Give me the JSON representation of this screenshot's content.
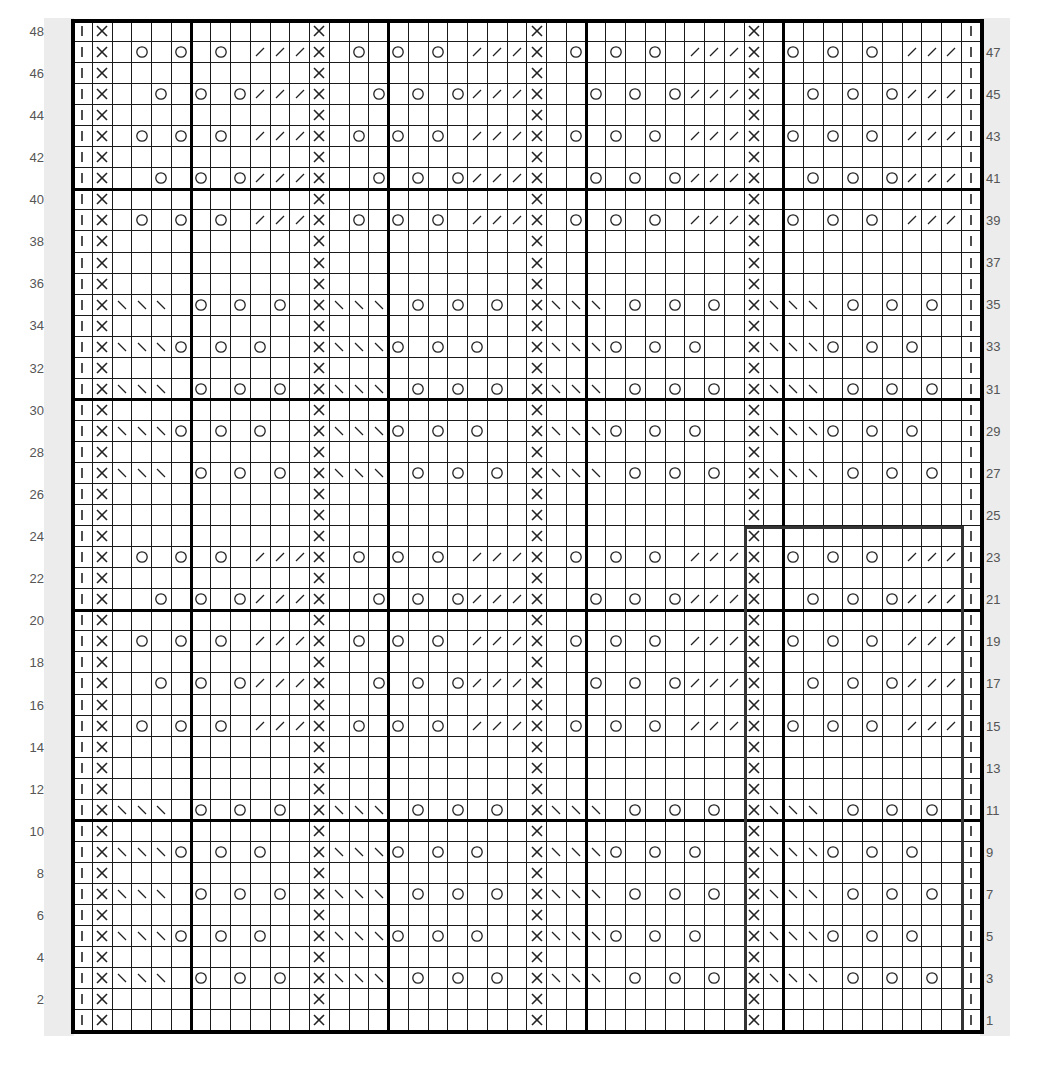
{
  "chart": {
    "columns": 46,
    "rows": 48,
    "repeat_width": 11,
    "repeat_start_col": 2,
    "edge_left_symbol": "knit-bar",
    "edge_right_symbol": "knit-bar",
    "thick_col_boundaries_after": [
      6,
      16,
      26,
      36
    ],
    "thick_row_boundaries_after": [
      10,
      20,
      30,
      40
    ],
    "highlight_box": {
      "col_start": 35,
      "col_end": 45,
      "row_start": 1,
      "row_end": 24,
      "color": "#333333"
    },
    "symbols": {
      "P": "blank",
      "X": "cross",
      "O": "yarn-over",
      "/": "slash-right",
      "\\": "slash-left",
      "_": "blank",
      "I": "knit-bar"
    },
    "row_types": {
      "A": [
        "X",
        "_",
        "O",
        "_",
        "O",
        "_",
        "O",
        "_",
        "/",
        "/",
        "/"
      ],
      "B": [
        "X",
        "_",
        "_",
        "O",
        "_",
        "O",
        "_",
        "O",
        "/",
        "/",
        "/"
      ],
      "C": [
        "X",
        "\\",
        "\\",
        "\\",
        "_",
        "O",
        "_",
        "O",
        "_",
        "O",
        "_"
      ],
      "D": [
        "X",
        "\\",
        "\\",
        "\\",
        "O",
        "_",
        "O",
        "_",
        "O",
        "_",
        "_"
      ],
      "P": [
        "X",
        "_",
        "_",
        "_",
        "_",
        "_",
        "_",
        "_",
        "_",
        "_",
        "_"
      ]
    },
    "row_sequence_top_to_bottom": [
      {
        "row": 48,
        "type": "P"
      },
      {
        "row": 47,
        "type": "A"
      },
      {
        "row": 46,
        "type": "P"
      },
      {
        "row": 45,
        "type": "B"
      },
      {
        "row": 44,
        "type": "P"
      },
      {
        "row": 43,
        "type": "A"
      },
      {
        "row": 42,
        "type": "P"
      },
      {
        "row": 41,
        "type": "B"
      },
      {
        "row": 40,
        "type": "P"
      },
      {
        "row": 39,
        "type": "A"
      },
      {
        "row": 38,
        "type": "P"
      },
      {
        "row": 37,
        "type": "P"
      },
      {
        "row": 36,
        "type": "P"
      },
      {
        "row": 35,
        "type": "C"
      },
      {
        "row": 34,
        "type": "P"
      },
      {
        "row": 33,
        "type": "D"
      },
      {
        "row": 32,
        "type": "P"
      },
      {
        "row": 31,
        "type": "C"
      },
      {
        "row": 30,
        "type": "P"
      },
      {
        "row": 29,
        "type": "D"
      },
      {
        "row": 28,
        "type": "P"
      },
      {
        "row": 27,
        "type": "C"
      },
      {
        "row": 26,
        "type": "P"
      },
      {
        "row": 25,
        "type": "P"
      },
      {
        "row": 24,
        "type": "P"
      },
      {
        "row": 23,
        "type": "A"
      },
      {
        "row": 22,
        "type": "P"
      },
      {
        "row": 21,
        "type": "B"
      },
      {
        "row": 20,
        "type": "P"
      },
      {
        "row": 19,
        "type": "A"
      },
      {
        "row": 18,
        "type": "P"
      },
      {
        "row": 17,
        "type": "B"
      },
      {
        "row": 16,
        "type": "P"
      },
      {
        "row": 15,
        "type": "A"
      },
      {
        "row": 14,
        "type": "P"
      },
      {
        "row": 13,
        "type": "P"
      },
      {
        "row": 12,
        "type": "P"
      },
      {
        "row": 11,
        "type": "C"
      },
      {
        "row": 10,
        "type": "P"
      },
      {
        "row": 9,
        "type": "D"
      },
      {
        "row": 8,
        "type": "P"
      },
      {
        "row": 7,
        "type": "C"
      },
      {
        "row": 6,
        "type": "P"
      },
      {
        "row": 5,
        "type": "D"
      },
      {
        "row": 4,
        "type": "P"
      },
      {
        "row": 3,
        "type": "C"
      },
      {
        "row": 2,
        "type": "P"
      },
      {
        "row": 1,
        "type": "P"
      }
    ]
  },
  "labels": {
    "left": [
      "48",
      "46",
      "44",
      "42",
      "40",
      "38",
      "36",
      "34",
      "32",
      "30",
      "28",
      "26",
      "24",
      "22",
      "20",
      "18",
      "16",
      "14",
      "12",
      "10",
      "8",
      "6",
      "4",
      "2"
    ],
    "right": [
      "47",
      "45",
      "43",
      "41",
      "39",
      "37",
      "35",
      "33",
      "31",
      "29",
      "27",
      "25",
      "23",
      "21",
      "19",
      "17",
      "15",
      "13",
      "11",
      "9",
      "7",
      "5",
      "3",
      "1"
    ]
  },
  "colors": {
    "grid_line": "#1a1a1a",
    "thick_line": "#000000",
    "label_strip": "#ececec",
    "label_text": "#555555",
    "symbol": "#222222"
  }
}
